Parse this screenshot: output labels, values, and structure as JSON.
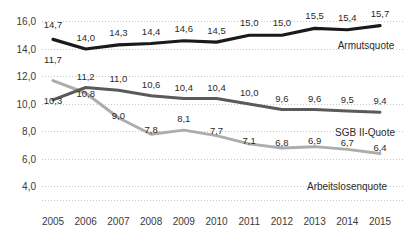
{
  "chart_data": {
    "type": "line",
    "title": "",
    "xlabel": "",
    "ylabel": "",
    "categories": [
      "2005",
      "2006",
      "2007",
      "2008",
      "2009",
      "2010",
      "2011",
      "2012",
      "2013",
      "2014",
      "2015"
    ],
    "ylim": [
      3.0,
      16.9
    ],
    "yticks": [
      "4,0",
      "6,0",
      "8,0",
      "10,0",
      "12,0",
      "14,0",
      "16,0"
    ],
    "ytick_values": [
      4.0,
      6.0,
      8.0,
      10.0,
      12.0,
      14.0,
      16.0
    ],
    "grid": true,
    "legend_position": "inline-right",
    "decimal_separator": ",",
    "series": [
      {
        "name": "Armutsquote",
        "color": "#1a1a1a",
        "values": [
          14.7,
          14.0,
          14.3,
          14.4,
          14.6,
          14.5,
          15.0,
          15.0,
          15.5,
          15.4,
          15.7
        ],
        "labels": [
          "14,7",
          "14,0",
          "14,3",
          "14,4",
          "14,6",
          "14,5",
          "15,0",
          "15,0",
          "15,5",
          "15,4",
          "15,7"
        ]
      },
      {
        "name": "SGB II-Quote",
        "color": "#5a5a5a",
        "values": [
          10.3,
          11.2,
          11.0,
          10.6,
          10.4,
          10.4,
          10.0,
          9.6,
          9.6,
          9.5,
          9.4
        ],
        "labels": [
          "10,3",
          "11,2",
          "11,0",
          "10,6",
          "10,4",
          "10,4",
          "10,0",
          "9,6",
          "9,6",
          "9,5",
          "9,4"
        ]
      },
      {
        "name": "Arbeitslosenquote",
        "color": "#adadad",
        "values": [
          11.7,
          10.8,
          9.0,
          7.8,
          8.1,
          7.7,
          7.1,
          6.8,
          6.9,
          6.7,
          6.4
        ],
        "labels": [
          "11,7",
          "10,8",
          "9,0",
          "7,8",
          "8,1",
          "7,7",
          "7,1",
          "6,8",
          "6,9",
          "6,7",
          "6,4"
        ]
      }
    ],
    "series_annotations": [
      {
        "name": "Armutsquote",
        "text": "Armutsquote"
      },
      {
        "name": "SGB II-Quote",
        "text": "SGB II-Quote"
      },
      {
        "name": "Arbeitslosenquote",
        "text": "Arbeitslosenquote"
      }
    ],
    "colors": {
      "grid": "#c8c8c8",
      "text": "#3a3a3a",
      "background": "#ffffff"
    }
  }
}
